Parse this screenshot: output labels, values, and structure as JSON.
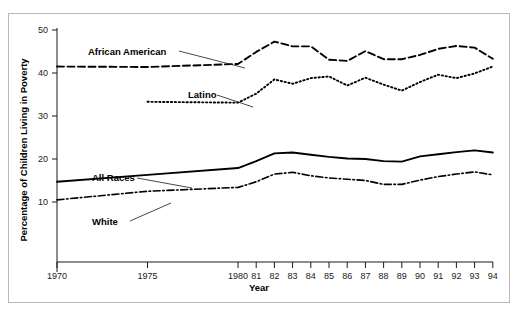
{
  "chart_data": {
    "type": "line",
    "title": "",
    "xlabel": "Year",
    "ylabel": "Percentage of Children Living in Poverty",
    "xlim": [
      1970,
      1994
    ],
    "ylim": [
      5,
      52
    ],
    "yticks": [
      10,
      20,
      30,
      40,
      50
    ],
    "ytick_labels": [
      "10",
      "20",
      "30",
      "40",
      "50"
    ],
    "xticks": [
      1970,
      1975,
      1980,
      1981,
      1982,
      1983,
      1984,
      1985,
      1986,
      1987,
      1988,
      1989,
      1990,
      1991,
      1992,
      1993,
      1994
    ],
    "xtick_labels": [
      "1970",
      "1975",
      "1980",
      "81",
      "82",
      "83",
      "84",
      "85",
      "86",
      "87",
      "88",
      "89",
      "90",
      "91",
      "92",
      "93",
      "94"
    ],
    "grid": false,
    "legend_position": "inline-annotations",
    "series": [
      {
        "name": "African American",
        "style": "dashed",
        "x": [
          1970,
          1975,
          1980,
          1981,
          1982,
          1983,
          1984,
          1985,
          1986,
          1987,
          1988,
          1989,
          1990,
          1991,
          1992,
          1993,
          1994
        ],
        "values": [
          41.5,
          41.4,
          42.1,
          44.9,
          47.3,
          46.2,
          46.2,
          43.1,
          42.8,
          45.1,
          43.2,
          43.2,
          44.2,
          45.6,
          46.3,
          45.9,
          43.3
        ]
      },
      {
        "name": "Latino",
        "style": "dotted",
        "x": [
          1975,
          1980,
          1981,
          1982,
          1983,
          1984,
          1985,
          1986,
          1987,
          1988,
          1989,
          1990,
          1991,
          1992,
          1993,
          1994
        ],
        "values": [
          33.3,
          33.1,
          35.2,
          38.5,
          37.5,
          38.8,
          39.2,
          37.1,
          38.9,
          37.3,
          35.9,
          37.9,
          39.6,
          38.8,
          39.9,
          41.5
        ]
      },
      {
        "name": "All Races",
        "style": "solid",
        "x": [
          1970,
          1975,
          1980,
          1981,
          1982,
          1983,
          1984,
          1985,
          1986,
          1987,
          1988,
          1989,
          1990,
          1991,
          1992,
          1993,
          1994
        ],
        "values": [
          14.7,
          16.3,
          17.9,
          19.5,
          21.3,
          21.5,
          21.0,
          20.5,
          20.1,
          20.0,
          19.5,
          19.4,
          20.6,
          21.1,
          21.6,
          22.0,
          21.5
        ]
      },
      {
        "name": "White",
        "style": "dash-dot",
        "x": [
          1970,
          1975,
          1980,
          1981,
          1982,
          1983,
          1984,
          1985,
          1986,
          1987,
          1988,
          1989,
          1990,
          1991,
          1992,
          1993,
          1994
        ],
        "values": [
          10.5,
          12.5,
          13.4,
          14.7,
          16.5,
          16.9,
          16.1,
          15.6,
          15.3,
          15.0,
          14.1,
          14.1,
          15.1,
          15.9,
          16.5,
          17.0,
          16.3
        ]
      }
    ],
    "annotations": [
      {
        "name": "African American",
        "label_x": 88,
        "label_y": 55,
        "leader": "M179,51 L245,68"
      },
      {
        "name": "Latino",
        "label_x": 188,
        "label_y": 98,
        "leader": "M217,95 L253,107"
      },
      {
        "name": "All Races",
        "label_x": 92,
        "label_y": 181,
        "leader": "M137,178 L192,188"
      },
      {
        "name": "White",
        "label_x": 92,
        "label_y": 225,
        "leader": "M130,221 L171,203"
      }
    ]
  }
}
